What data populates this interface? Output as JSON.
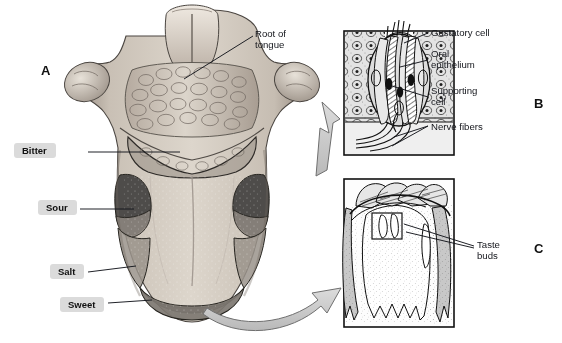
{
  "figure": {
    "panels": [
      {
        "letter": "A",
        "name": "tongue-surface-view"
      },
      {
        "letter": "B",
        "name": "taste-bud-microstructure"
      },
      {
        "letter": "C",
        "name": "papilla-cross-section"
      }
    ]
  },
  "panel_letters": {
    "a": "A",
    "b": "B",
    "c": "C"
  },
  "panel_a": {
    "taste_regions": [
      {
        "label": "Bitter",
        "shade": "#7d7670"
      },
      {
        "label": "Sour",
        "shade": "#4b4a48"
      },
      {
        "label": "Salt",
        "shade": "#8a8580"
      },
      {
        "label": "Sweet",
        "shade": "#6f6a66"
      }
    ],
    "labels": {
      "root_of_tongue": "Root of\ntongue"
    }
  },
  "panel_b": {
    "labels": {
      "gustatory_cell": "Gustatory cell",
      "oral_epithelium": "Oral\nepithelium",
      "supporting_cell": "Supporting\ncell",
      "nerve_fibers": "Nerve fibers"
    }
  },
  "panel_c": {
    "labels": {
      "taste_buds": "Taste\nbuds"
    }
  },
  "colors": {
    "ink": "#14161c",
    "paper": "#ffffff",
    "arrow_fill": "#c9c9c9",
    "arrow_stroke": "#6f6f6f",
    "callout_bg": "#cdcdcd",
    "tissue_light": "#cfc7bd",
    "tissue_mid": "#a79d92",
    "tissue_dark": "#6f675f"
  }
}
